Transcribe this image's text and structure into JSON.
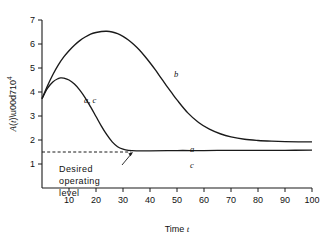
{
  "chart_data": {
    "type": "line",
    "title": "",
    "xlabel": "Time t",
    "ylabel": "A(t)×10⁴",
    "ylabel_parts": {
      "fn": "A(t)",
      "mult": "×10",
      "exp": "4"
    },
    "xlim": [
      0,
      100
    ],
    "ylim": [
      0,
      7
    ],
    "xticks": [
      0,
      10,
      20,
      30,
      40,
      50,
      60,
      70,
      80,
      90,
      100
    ],
    "xtick_labels": [
      "0",
      "10",
      "20",
      "30",
      "40",
      "50",
      "60",
      "70",
      "80",
      "90",
      "100"
    ],
    "yticks": [
      0,
      1,
      2,
      3,
      4,
      5,
      6,
      7
    ],
    "ytick_labels": [
      "1",
      "2",
      "3",
      "4",
      "5",
      "6",
      "7"
    ],
    "grid": false,
    "legend_position": "inline-curve-labels",
    "reference_line": {
      "label": "Desired operating level",
      "y_value": 1.5,
      "style": "dashed"
    },
    "annotations": [
      {
        "name": "desired-operating-level",
        "text_lines": [
          "Desired",
          "operating",
          "level"
        ],
        "x": 22,
        "y": 0.95
      },
      {
        "name": "curve-label-ac",
        "text": "a, c",
        "x": 17,
        "y": 4.05
      },
      {
        "name": "curve-label-b",
        "text": "b",
        "x": 49,
        "y": 4.6
      },
      {
        "name": "curve-label-a-flat",
        "text": "a",
        "x": 55,
        "y": 1.85
      },
      {
        "name": "curve-label-c-flat",
        "text": "c",
        "x": 55,
        "y": 1.3
      }
    ],
    "series": [
      {
        "name": "b",
        "label": "b",
        "points": [
          [
            0,
            3.72
          ],
          [
            2,
            4.25
          ],
          [
            4,
            4.72
          ],
          [
            6,
            5.12
          ],
          [
            8,
            5.45
          ],
          [
            10,
            5.72
          ],
          [
            12,
            5.95
          ],
          [
            14,
            6.14
          ],
          [
            16,
            6.29
          ],
          [
            18,
            6.41
          ],
          [
            20,
            6.48
          ],
          [
            22,
            6.52
          ],
          [
            24,
            6.53
          ],
          [
            26,
            6.5
          ],
          [
            28,
            6.43
          ],
          [
            30,
            6.32
          ],
          [
            32,
            6.17
          ],
          [
            34,
            5.98
          ],
          [
            36,
            5.76
          ],
          [
            38,
            5.5
          ],
          [
            40,
            5.22
          ],
          [
            42,
            4.92
          ],
          [
            44,
            4.6
          ],
          [
            46,
            4.28
          ],
          [
            48,
            3.97
          ],
          [
            50,
            3.67
          ],
          [
            54,
            3.13
          ],
          [
            58,
            2.73
          ],
          [
            62,
            2.45
          ],
          [
            66,
            2.26
          ],
          [
            70,
            2.13
          ],
          [
            75,
            2.03
          ],
          [
            80,
            1.98
          ],
          [
            85,
            1.95
          ],
          [
            90,
            1.93
          ],
          [
            95,
            1.92
          ],
          [
            100,
            1.92
          ]
        ]
      },
      {
        "name": "a_c",
        "label": "a, c",
        "points": [
          [
            0,
            3.72
          ],
          [
            2,
            4.15
          ],
          [
            4,
            4.42
          ],
          [
            6,
            4.56
          ],
          [
            7,
            4.59
          ],
          [
            8,
            4.58
          ],
          [
            10,
            4.5
          ],
          [
            12,
            4.33
          ],
          [
            14,
            4.08
          ],
          [
            16,
            3.76
          ],
          [
            18,
            3.38
          ],
          [
            20,
            2.98
          ],
          [
            22,
            2.58
          ],
          [
            24,
            2.22
          ],
          [
            26,
            1.92
          ],
          [
            28,
            1.72
          ],
          [
            30,
            1.62
          ],
          [
            32,
            1.57
          ],
          [
            35,
            1.55
          ],
          [
            40,
            1.55
          ],
          [
            50,
            1.56
          ],
          [
            60,
            1.56
          ],
          [
            70,
            1.57
          ],
          [
            80,
            1.57
          ],
          [
            90,
            1.57
          ],
          [
            100,
            1.58
          ]
        ]
      }
    ],
    "colors": {
      "curve": "#1a1a1a",
      "axis": "#1a1a1a",
      "reference": "#1a1a1a",
      "background": "#ffffff"
    }
  }
}
